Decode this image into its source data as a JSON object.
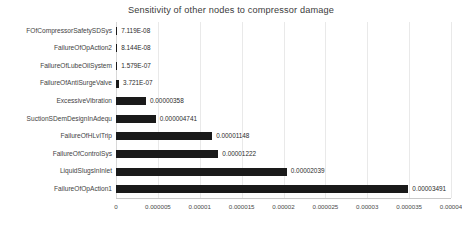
{
  "chart_data": {
    "type": "bar",
    "orientation": "horizontal",
    "title": "Sensitivity of other nodes to compressor damage",
    "xlabel": "",
    "ylabel": "",
    "xlim": [
      0,
      4e-05
    ],
    "grid": true,
    "legend": "none",
    "bar_color": "#1a1a1a",
    "xticks": [
      "0",
      "0.000005",
      "0.00001",
      "0.000015",
      "0.00002",
      "0.000025",
      "0.00003",
      "0.000035",
      "0.00004"
    ],
    "xtick_values": [
      0,
      5e-06,
      1e-05,
      1.5e-05,
      2e-05,
      2.5e-05,
      3e-05,
      3.5e-05,
      4e-05
    ],
    "categories": [
      "FOfCompressorSafetySDSys",
      "FailureOfOpAction2",
      "FailureOfLubeOilSystem",
      "FailureOfAntiSurgeValve",
      "ExcessiveVibration",
      "SuctionSDemDesignInAdequ",
      "FailureOfHLvlTrip",
      "FailureOfControlSys",
      "LiquidSlugsInInlet",
      "FailureOfOpAction1"
    ],
    "values": [
      7.119e-08,
      8.144e-08,
      1.579e-07,
      3.721e-07,
      3.58e-06,
      4.741e-06,
      1.148e-05,
      1.222e-05,
      2.039e-05,
      3.491e-05
    ],
    "value_labels": [
      "7.119E-08",
      "8.144E-08",
      "1.579E-07",
      "3.721E-07",
      "0.00000358",
      "0.000004741",
      "0.00001148",
      "0.00001222",
      "0.00002039",
      "0.00003491"
    ]
  }
}
